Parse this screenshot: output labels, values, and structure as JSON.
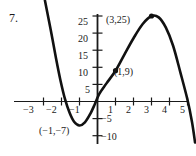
{
  "problem": {
    "number": "7."
  },
  "chart_data": {
    "type": "line",
    "title": "",
    "xlabel": "",
    "ylabel": "",
    "xlim": [
      -3.6,
      5.7
    ],
    "ylim": [
      -13,
      30
    ],
    "grid": false,
    "legend": null,
    "function_description": "cubic curve with local minimum (-1,-7) and local maximum (3,25)",
    "x_ticks": [
      -3,
      -2,
      -1,
      1,
      2,
      3,
      4,
      5
    ],
    "x_tick_labels": [
      "−3",
      "−2",
      "−1",
      "1",
      "2",
      "3",
      "4",
      "5"
    ],
    "y_ticks": [
      5,
      10,
      15,
      20,
      25,
      -5,
      -10
    ],
    "y_tick_labels": [
      "5",
      "10",
      "15",
      "20",
      "25",
      "−5",
      "−10"
    ],
    "marked_points": [
      {
        "x": 3,
        "y": 25,
        "label": "(3,25)",
        "marker": "filled-dot"
      },
      {
        "x": 1,
        "y": 9,
        "label": "(1,9)",
        "marker": "filled-dot"
      },
      {
        "x": -1,
        "y": -7,
        "label": "(−1,−7)",
        "marker": "none"
      }
    ],
    "curve_points": [
      {
        "x": -2.92,
        "y": 29.5
      },
      {
        "x": -2.6,
        "y": 21.0
      },
      {
        "x": -2.3,
        "y": 12.5
      },
      {
        "x": -2.05,
        "y": 6.0
      },
      {
        "x": -1.8,
        "y": 0.6
      },
      {
        "x": -1.55,
        "y": -3.3
      },
      {
        "x": -1.3,
        "y": -5.9
      },
      {
        "x": -1.0,
        "y": -7.0
      },
      {
        "x": -0.7,
        "y": -6.1
      },
      {
        "x": -0.4,
        "y": -3.6
      },
      {
        "x": -0.15,
        "y": -0.8
      },
      {
        "x": 0.1,
        "y": 2.2
      },
      {
        "x": 0.5,
        "y": 5.3
      },
      {
        "x": 1.0,
        "y": 9.0
      },
      {
        "x": 1.5,
        "y": 13.8
      },
      {
        "x": 2.0,
        "y": 18.5
      },
      {
        "x": 2.5,
        "y": 22.6
      },
      {
        "x": 3.0,
        "y": 25.0
      },
      {
        "x": 3.4,
        "y": 24.6
      },
      {
        "x": 3.8,
        "y": 21.6
      },
      {
        "x": 4.2,
        "y": 16.3
      },
      {
        "x": 4.6,
        "y": 8.6
      },
      {
        "x": 5.0,
        "y": 0.5
      },
      {
        "x": 5.25,
        "y": -6.0
      },
      {
        "x": 5.42,
        "y": -12.0
      }
    ],
    "axis_color": "#1a1a1a",
    "curve_color": "#111111"
  }
}
